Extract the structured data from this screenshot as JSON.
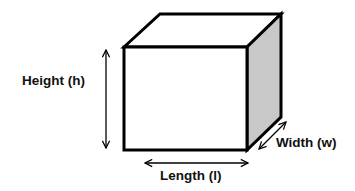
{
  "diagram": {
    "type": "rectangular-prism-dimensions",
    "shape": "cube",
    "labels": {
      "height": "Height (h)",
      "length": "Length (l)",
      "width": "Width (w)"
    },
    "colors": {
      "stroke": "#000000",
      "front_face": "#ffffff",
      "top_face": "#ffffff",
      "side_face": "#c8c8c8",
      "text": "#111111"
    }
  }
}
